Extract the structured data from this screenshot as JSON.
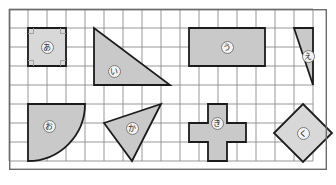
{
  "figure": {
    "canvas": {
      "width": 336,
      "height": 185,
      "background": "#ffffff"
    },
    "grid": {
      "origin_x": 9,
      "origin_y": 9,
      "cell_size": 19.0,
      "columns": 16,
      "rows": 8,
      "line_color": "#8d8d8d",
      "border_color": "#6b6b6b",
      "line_width": 0.9,
      "border_width": 1.4
    },
    "style": {
      "shape_fill": "#c9c9c9",
      "shape_fill_light": "#d8d8d8",
      "shape_stroke": "#1c1c1c",
      "shape_stroke_width": 1.8,
      "label_bg": "#f2f2f2",
      "label_border": "#7a7a7a",
      "label_text": "#1a1a1a"
    },
    "shapes": [
      {
        "id": "shape-a",
        "label": "あ",
        "name": "square",
        "kind": "polygon",
        "fill": "#d8d8d8",
        "points": "19,19 57,19 57,57 19,57",
        "label_x": 38,
        "label_y": 38,
        "right_angles": [
          {
            "x": 19,
            "y": 19,
            "dx": 1,
            "dy": 1
          },
          {
            "x": 57,
            "y": 19,
            "dx": -1,
            "dy": 1
          },
          {
            "x": 19,
            "y": 57,
            "dx": 1,
            "dy": -1
          },
          {
            "x": 57,
            "y": 57,
            "dx": -1,
            "dy": -1
          }
        ]
      },
      {
        "id": "shape-i",
        "label": "い",
        "name": "right-triangle",
        "kind": "polygon",
        "fill": "#c9c9c9",
        "points": "85,19 85,76 161,76",
        "label_x": 105,
        "label_y": 62,
        "right_angles": []
      },
      {
        "id": "shape-u",
        "label": "う",
        "name": "rectangle",
        "kind": "polygon",
        "fill": "#c9c9c9",
        "points": "180,19 256,19 256,57 180,57",
        "label_x": 218,
        "label_y": 38,
        "right_angles": []
      },
      {
        "id": "shape-e",
        "label": "え",
        "name": "oblique-triangle",
        "kind": "polygon",
        "fill": "#c9c9c9",
        "points": "285,19 304,19 304,76",
        "label_x": 299,
        "label_y": 47,
        "right_angles": []
      },
      {
        "id": "shape-o",
        "label": "お",
        "name": "quarter-circle",
        "kind": "path",
        "fill": "#c9c9c9",
        "d": "M 19,95 L 76,95 A 57,57 0 0 1 19,152 Z",
        "label_x": 40,
        "label_y": 117,
        "right_angles": []
      },
      {
        "id": "shape-ka",
        "label": "か",
        "name": "scalene-triangle",
        "kind": "polygon",
        "fill": "#c9c9c9",
        "points": "95,114 152,95 123,152",
        "label_x": 123,
        "label_y": 119,
        "right_angles": []
      },
      {
        "id": "shape-ki",
        "label": "き",
        "name": "cross",
        "kind": "polygon",
        "fill": "#c9c9c9",
        "points": "199,95 218,95 218,114 237,114 237,133 218,133 218,152 199,152 199,133 180,133 180,114 199,114",
        "label_x": 208,
        "label_y": 114,
        "right_angles": []
      },
      {
        "id": "shape-ku",
        "label": "く",
        "name": "diamond",
        "kind": "polygon",
        "fill": "#d8d8d8",
        "points": "294,95 323,124 294,153 265,124",
        "label_x": 294,
        "label_y": 124,
        "right_angles": []
      }
    ]
  }
}
